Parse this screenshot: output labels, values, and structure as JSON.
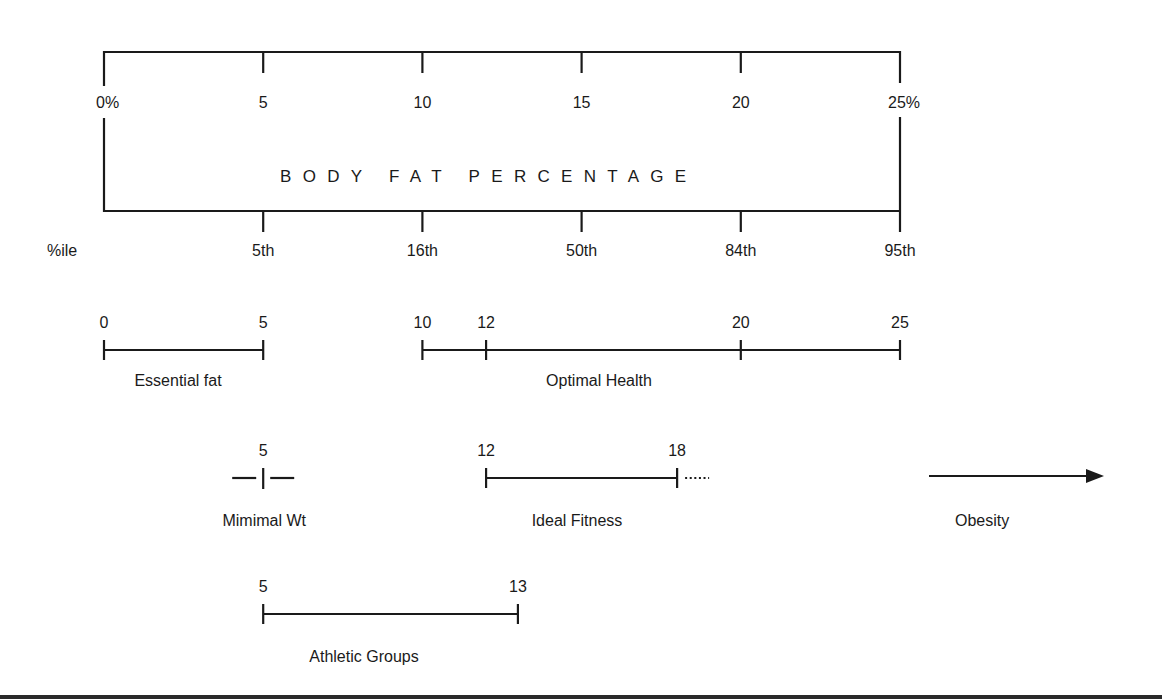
{
  "chart_data": {
    "type": "diagram",
    "title": "BODY FAT PERCENTAGE",
    "scale": {
      "min": 0,
      "max": 25,
      "ticks": [
        0,
        5,
        10,
        15,
        20,
        25
      ],
      "tick_labels": [
        "0%",
        "5",
        "10",
        "15",
        "20",
        "25%"
      ]
    },
    "percentiles": {
      "label": "%ile",
      "ticks": [
        5,
        10,
        15,
        20,
        25
      ],
      "labels": [
        "5th",
        "16th",
        "50th",
        "84th",
        "95th"
      ]
    },
    "ranges": [
      {
        "name": "Essential fat",
        "start": 0,
        "end": 5,
        "marks": [
          0,
          5
        ],
        "mark_labels": [
          "0",
          "5"
        ]
      },
      {
        "name": "Optimal Health",
        "start": 10,
        "end": 25,
        "marks": [
          10,
          12,
          20,
          25
        ],
        "mark_labels": [
          "10",
          "12",
          "20",
          "25"
        ]
      },
      {
        "name": "Mimimal Wt",
        "point": 5,
        "marks": [
          5
        ],
        "mark_labels": [
          "5"
        ]
      },
      {
        "name": "Ideal Fitness",
        "start": 12,
        "end": 18,
        "marks": [
          12,
          18
        ],
        "mark_labels": [
          "12",
          "18"
        ],
        "continues_dotted": true
      },
      {
        "name": "Obesity",
        "direction": "arrow-right"
      },
      {
        "name": "Athletic Groups",
        "start": 5,
        "end": 13,
        "marks": [
          5,
          13
        ],
        "mark_labels": [
          "5",
          "13"
        ]
      }
    ]
  },
  "layout": {
    "x0": 104,
    "px_per_unit": 31.84,
    "colors": {
      "ink": "#1a1a1a",
      "background": "#ffffff"
    }
  }
}
